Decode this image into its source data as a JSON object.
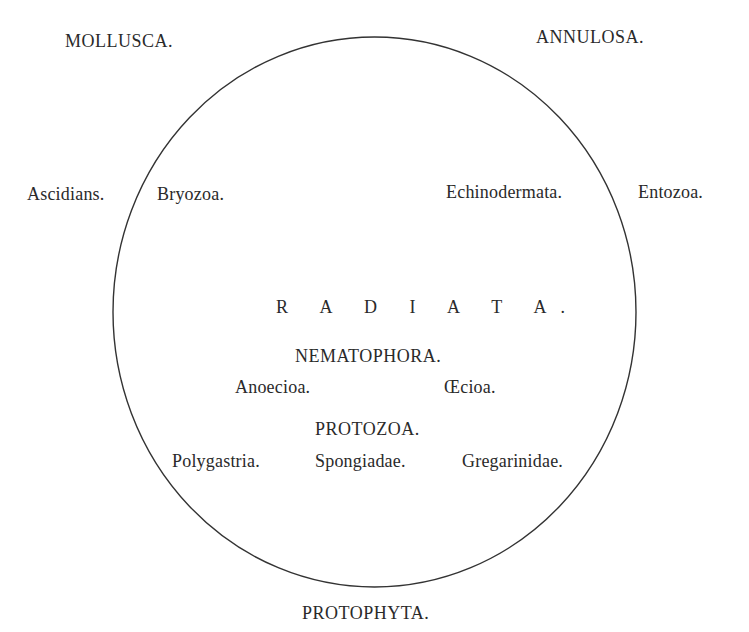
{
  "diagram": {
    "outside": {
      "top_left": "MOLLUSCA.",
      "top_right": "ANNULOSA.",
      "left": "Ascidians.",
      "right": "Entozoa.",
      "bottom": "PROTOPHYTA."
    },
    "inside": {
      "upper_left": "Bryozoa.",
      "upper_right": "Echinodermata.",
      "center_title": "R A D I A T A.",
      "group1": {
        "title": "NEMATOPHORA.",
        "members": [
          "Anoecioa.",
          "Œcioa."
        ]
      },
      "group2": {
        "title": "PROTOZOA.",
        "members": [
          "Polygastria.",
          "Spongiadae.",
          "Gregarinidae."
        ]
      }
    },
    "colors": {
      "line": "#333333",
      "text": "#2a2a2a",
      "background": "#ffffff"
    }
  }
}
